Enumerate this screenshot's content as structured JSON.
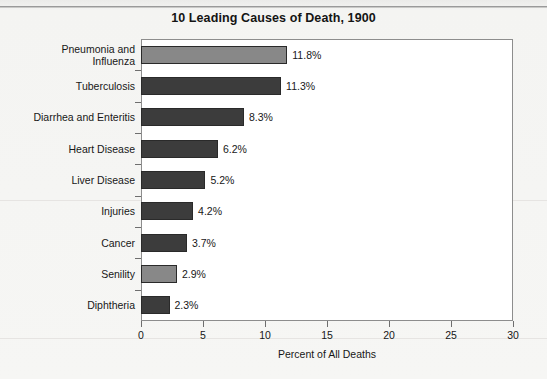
{
  "chart_data": {
    "type": "bar",
    "orientation": "horizontal",
    "title": "10 Leading Causes of Death, 1900",
    "xlabel": "Percent of All Deaths",
    "ylabel": "",
    "xlim": [
      0,
      30
    ],
    "xticks": [
      "0",
      "5",
      "10",
      "15",
      "20",
      "25",
      "30"
    ],
    "grid": false,
    "legend": "none",
    "categories": [
      "Pneumonia and\nInfluenza",
      "Tuberculosis",
      "Diarrhea and Enteritis",
      "Heart Disease",
      "Liver Disease",
      "Injuries",
      "Cancer",
      "Senility",
      "Diphtheria"
    ],
    "values": [
      11.8,
      11.3,
      8.3,
      6.2,
      5.2,
      4.2,
      3.7,
      2.9,
      2.3
    ],
    "value_labels": [
      "11.8%",
      "11.3%",
      "8.3%",
      "6.2%",
      "5.2%",
      "4.2%",
      "3.7%",
      "2.9%",
      "2.3%"
    ],
    "bar_colors": [
      "#888888",
      "#3c3c3c",
      "#3c3c3c",
      "#3c3c3c",
      "#3c3c3c",
      "#3c3c3c",
      "#3c3c3c",
      "#888888",
      "#3c3c3c"
    ]
  },
  "colors": {
    "bar_dark": "#3c3c3c",
    "bar_light": "#888888",
    "bar_edge": "#2a2a2a",
    "plot_background": "#ffffff",
    "plot_border": "#8d8d8d",
    "page_background": "#f4f4f2",
    "text": "#171717"
  }
}
